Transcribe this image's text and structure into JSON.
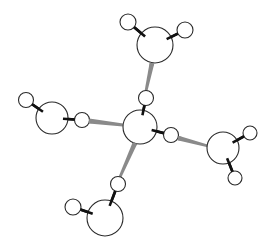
{
  "diagram": {
    "type": "molecular-structure",
    "colors": {
      "background": "#ffffff",
      "atom_fill": "#ffffff",
      "atom_stroke": "#2a2a2a",
      "covalent_bond": "#111111",
      "hydrogen_bond": "#8a8a8a"
    },
    "molecules": [
      {
        "id": "top",
        "oxygen": {
          "x": 155,
          "y": 45,
          "r": 18
        },
        "hydrogens": [
          {
            "x": 128,
            "y": 22,
            "r": 8
          },
          {
            "x": 185,
            "y": 30,
            "r": 8
          }
        ]
      },
      {
        "id": "center",
        "oxygen": {
          "x": 140,
          "y": 127,
          "r": 17
        },
        "hydrogens": [
          {
            "x": 146,
            "y": 98,
            "r": 7.5
          },
          {
            "x": 171,
            "y": 135,
            "r": 7.5
          }
        ]
      },
      {
        "id": "left",
        "oxygen": {
          "x": 52,
          "y": 118,
          "r": 16
        },
        "hydrogens": [
          {
            "x": 26,
            "y": 100,
            "r": 7.5
          },
          {
            "x": 82,
            "y": 120,
            "r": 7.5
          }
        ]
      },
      {
        "id": "right",
        "oxygen": {
          "x": 223,
          "y": 148,
          "r": 16
        },
        "hydrogens": [
          {
            "x": 250,
            "y": 133,
            "r": 7
          },
          {
            "x": 235,
            "y": 178,
            "r": 7
          }
        ]
      },
      {
        "id": "bottom",
        "oxygen": {
          "x": 105,
          "y": 218,
          "r": 18
        },
        "hydrogens": [
          {
            "x": 73,
            "y": 207,
            "r": 8
          },
          {
            "x": 118,
            "y": 184,
            "r": 7.5
          }
        ]
      }
    ],
    "hydrogen_bonds": [
      {
        "from": "top.O",
        "to": "center.H1",
        "x1": 152,
        "y1": 63,
        "x2": 146,
        "y2": 91
      },
      {
        "from": "left.H2",
        "to": "center.O",
        "x1": 89,
        "y1": 121,
        "x2": 123,
        "y2": 125
      },
      {
        "from": "center.H2",
        "to": "right.O",
        "x1": 178,
        "y1": 138,
        "x2": 208,
        "y2": 146
      },
      {
        "from": "center.O",
        "to": "bottom.H2",
        "x1": 135,
        "y1": 143,
        "x2": 120,
        "y2": 177
      }
    ]
  }
}
